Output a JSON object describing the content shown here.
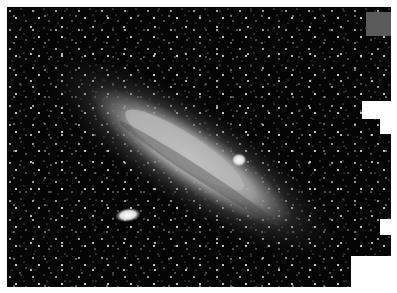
{
  "image": {
    "subject": "Spiral galaxy with two satellite galaxies in a dense star field",
    "description": "Grayscale astronomical photograph of a large, tilted spiral galaxy (Andromeda-like) running diagonally from upper-left to lower-right, with a bright elongated satellite at lower-left and a compact satellite near the upper edge of the disk",
    "colors": {
      "background": "#050505",
      "galaxy_core": "#c8c8c8",
      "galaxy_halo": "#7a7a7a",
      "stars": "#e8e8e8",
      "gray_patch": "#5a5a5a",
      "page": "#ffffff"
    }
  }
}
